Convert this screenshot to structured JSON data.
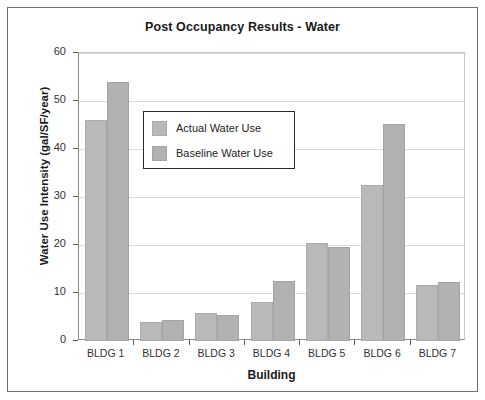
{
  "chart_data": {
    "type": "bar",
    "title": "Post Occupancy Results - Water",
    "xlabel": "Building",
    "ylabel": "Water Use Intensity (gal/SF/year)",
    "categories": [
      "BLDG 1",
      "BLDG 2",
      "BLDG 3",
      "BLDG 4",
      "BLDG 5",
      "BLDG 6",
      "BLDG 7"
    ],
    "series": [
      {
        "name": "Actual Water Use",
        "color": "#b9b9b9",
        "values": [
          46,
          4.0,
          5.8,
          8.2,
          20.5,
          32.5,
          11.7
        ]
      },
      {
        "name": "Baseline Water Use",
        "color": "#b2b2b2",
        "values": [
          54,
          4.3,
          5.5,
          12.5,
          19.5,
          45.2,
          12.3
        ]
      }
    ],
    "ylim": [
      0,
      60
    ],
    "yticks": [
      0,
      10,
      20,
      30,
      40,
      50,
      60
    ],
    "ytick_labels": [
      "0",
      "10",
      "20",
      "30",
      "40",
      "50",
      "60"
    ],
    "grid": true,
    "grid_axis": "y",
    "legend_position": "upper-left-inside"
  },
  "legend": {
    "entries": [
      {
        "label": "Actual Water Use"
      },
      {
        "label": "Baseline Water Use"
      }
    ]
  },
  "figure": {
    "frame_color": "#6f6f6f",
    "background": "#ffffff"
  }
}
